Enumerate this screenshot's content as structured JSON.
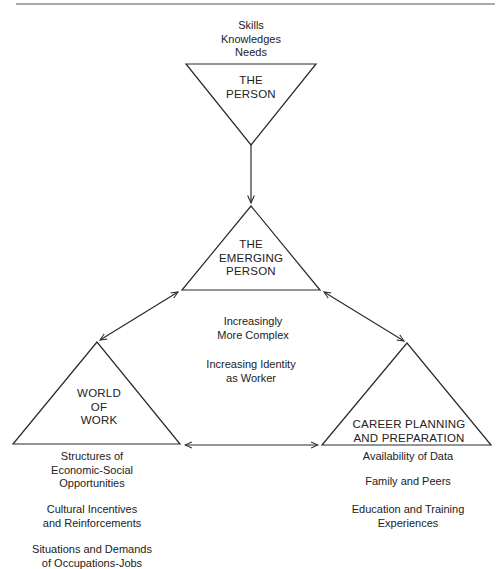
{
  "nodes": {
    "person": {
      "title": [
        "THE",
        "PERSON"
      ],
      "attributes": [
        "Skills",
        "Knowledges",
        "Needs"
      ]
    },
    "emerging_person": {
      "title": [
        "THE",
        "EMERGING",
        "PERSON"
      ]
    },
    "world_of_work": {
      "title": [
        "WORLD",
        "OF",
        "WORK"
      ],
      "factors": [
        [
          "Structures of",
          "Economic-Social",
          "Opportunities"
        ],
        [
          "Cultural Incentives",
          "and Reinforcements"
        ],
        [
          "Situations and Demands",
          "of Occupations-Jobs"
        ]
      ]
    },
    "career_planning": {
      "title": [
        "CAREER PLANNING",
        "AND PREPARATION"
      ],
      "factors": [
        [
          "Availability of Data"
        ],
        [
          "Family and Peers"
        ],
        [
          "Education and Training",
          "Experiences"
        ]
      ]
    }
  },
  "center_notes": [
    [
      "Increasingly",
      "More Complex"
    ],
    [
      "Increasing Identity",
      "as Worker"
    ]
  ],
  "edges": [
    {
      "from": "person",
      "to": "emerging_person",
      "type": "one-way"
    },
    {
      "from": "emerging_person",
      "to": "world_of_work",
      "type": "two-way"
    },
    {
      "from": "emerging_person",
      "to": "career_planning",
      "type": "two-way"
    },
    {
      "from": "world_of_work",
      "to": "career_planning",
      "type": "two-way"
    }
  ],
  "colors": {
    "line": "#2a2a2a",
    "text": "#222222",
    "rule": "#555555"
  }
}
